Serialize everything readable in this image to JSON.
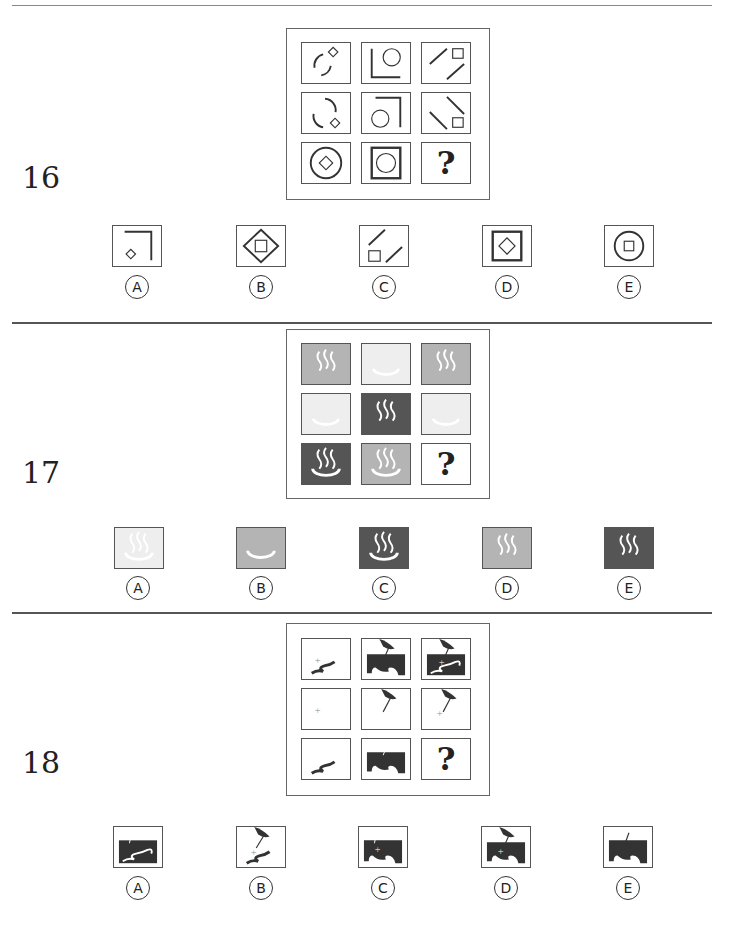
{
  "questions": [
    {
      "number": "16",
      "missing_cell": "?",
      "options": [
        {
          "label": "A",
          "glyph": "Ⓐ",
          "description": "corner line with small diamond"
        },
        {
          "label": "B",
          "glyph": "Ⓑ",
          "description": "diamond containing square"
        },
        {
          "label": "C",
          "glyph": "Ⓒ",
          "description": "two diagonal lines with square"
        },
        {
          "label": "D",
          "glyph": "Ⓓ",
          "description": "square containing diamond"
        },
        {
          "label": "E",
          "glyph": "Ⓔ",
          "description": "circle containing square"
        }
      ]
    },
    {
      "number": "17",
      "missing_cell": "?",
      "colors": {
        "light": "#eeeeee",
        "mid": "#b4b4b4",
        "dark": "#555555"
      },
      "options": [
        {
          "label": "A",
          "glyph": "Ⓐ",
          "description": "light tile with faint hot-spring symbol"
        },
        {
          "label": "B",
          "glyph": "Ⓑ",
          "description": "mid-gray tile with basin only"
        },
        {
          "label": "C",
          "glyph": "Ⓒ",
          "description": "dark tile with full hot-spring symbol"
        },
        {
          "label": "D",
          "glyph": "Ⓓ",
          "description": "mid-gray tile with steam only"
        },
        {
          "label": "E",
          "glyph": "Ⓔ",
          "description": "dark tile with steam only"
        }
      ]
    },
    {
      "number": "18",
      "missing_cell": "?",
      "options": [
        {
          "label": "A",
          "glyph": "Ⓐ",
          "description": "dark block with river"
        },
        {
          "label": "B",
          "glyph": "Ⓑ",
          "description": "pin with river and cross"
        },
        {
          "label": "C",
          "glyph": "Ⓒ",
          "description": "dark block with cross"
        },
        {
          "label": "D",
          "glyph": "Ⓓ",
          "description": "pin with dark block and cross"
        },
        {
          "label": "E",
          "glyph": "Ⓔ",
          "description": "dark block with stick"
        }
      ]
    }
  ]
}
